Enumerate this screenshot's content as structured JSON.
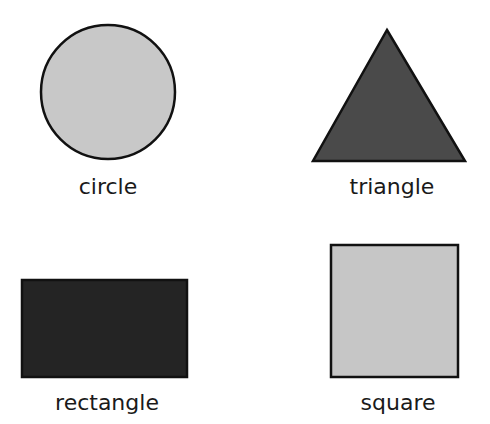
{
  "shapes": [
    {
      "name": "circle",
      "label": "circle",
      "fill": "#c8c8c8",
      "stroke": "#111111"
    },
    {
      "name": "triangle",
      "label": "triangle",
      "fill": "#4a4a4a",
      "stroke": "#111111"
    },
    {
      "name": "rectangle",
      "label": "rectangle",
      "fill": "#242424",
      "stroke": "#111111"
    },
    {
      "name": "square",
      "label": "square",
      "fill": "#c6c6c6",
      "stroke": "#111111"
    }
  ]
}
